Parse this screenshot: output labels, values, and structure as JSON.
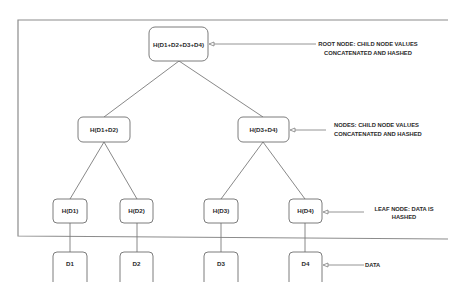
{
  "diagram": {
    "root": {
      "id": "root",
      "label": "H(D1+D2+D3+D4)",
      "x": 149,
      "y": 27,
      "w": 59,
      "h": 34
    },
    "level1": [
      {
        "id": "h12",
        "label": "H(D1+D2)",
        "x": 78,
        "y": 117,
        "w": 52,
        "h": 25
      },
      {
        "id": "h34",
        "label": "H(D3+D4)",
        "x": 238,
        "y": 117,
        "w": 51,
        "h": 25
      }
    ],
    "leaves": [
      {
        "id": "hd1",
        "label": "H(D1)",
        "x": 53,
        "y": 199,
        "w": 34,
        "h": 24
      },
      {
        "id": "hd2",
        "label": "H(D2)",
        "x": 120,
        "y": 199,
        "w": 33,
        "h": 24
      },
      {
        "id": "hd3",
        "label": "H(D3)",
        "x": 204,
        "y": 199,
        "w": 34,
        "h": 24
      },
      {
        "id": "hd4",
        "label": "H(D4)",
        "x": 289,
        "y": 199,
        "w": 33,
        "h": 24
      }
    ],
    "data": [
      {
        "id": "d1",
        "label": "D1",
        "x": 53,
        "y": 252,
        "w": 34,
        "h": 30
      },
      {
        "id": "d2",
        "label": "D2",
        "x": 120,
        "y": 252,
        "w": 33,
        "h": 30
      },
      {
        "id": "d3",
        "label": "D3",
        "x": 204,
        "y": 252,
        "w": 34,
        "h": 30
      },
      {
        "id": "d4",
        "label": "D4",
        "x": 289,
        "y": 252,
        "w": 33,
        "h": 30
      }
    ],
    "annotations": {
      "root": {
        "line1": "ROOT NODE: CHILD NODE VALUES",
        "line2": "CONCATENATED AND HASHED"
      },
      "nodes": {
        "line1": "NODES: CHILD NODE VALUES",
        "line2": "CONCATENATED AND HASHED"
      },
      "leaf": {
        "line1": "LEAF NODE: DATA IS",
        "line2": "HASHED"
      },
      "data": {
        "line1": "DATA"
      }
    },
    "colors": {
      "stroke": "#6e6e6e",
      "frame": "#8c8c8c",
      "text": "#2a2a2a"
    }
  }
}
